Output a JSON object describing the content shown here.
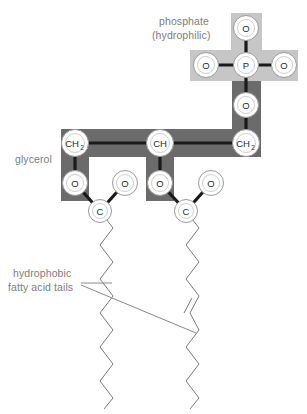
{
  "diagram": {
    "width": 307,
    "height": 414,
    "background": "#ffffff"
  },
  "labels": {
    "phosphate_line1": "phosphate",
    "phosphate_line2": "(hydrophilic)",
    "glycerol": "glycerol",
    "tails_line1": "hydrophobic",
    "tails_line2": "fatty acid tails"
  },
  "colors": {
    "label_text": "#7d7d7d",
    "atom_text": "#2b2b2b",
    "atom_fill": "#ffffff",
    "atom_stroke": "#9a9a9a",
    "bond": "#1a1a1a",
    "highlight_light": "#c6c6c6",
    "highlight_dark": "#6b6b6b",
    "tail_stroke": "#7a7a7a",
    "leader": "#8a8a8a"
  },
  "atoms": {
    "phosphate": [
      {
        "symbol": "O",
        "sub": "",
        "x": 246,
        "y": 28
      },
      {
        "symbol": "O",
        "sub": "",
        "x": 206,
        "y": 65
      },
      {
        "symbol": "P",
        "sub": "",
        "x": 246,
        "y": 65
      },
      {
        "symbol": "O",
        "sub": "",
        "x": 284,
        "y": 65
      },
      {
        "symbol": "O",
        "sub": "",
        "x": 246,
        "y": 105
      }
    ],
    "glycerol": [
      {
        "symbol": "CH",
        "sub": "2",
        "x": 75,
        "y": 143
      },
      {
        "symbol": "CH",
        "sub": "",
        "x": 160,
        "y": 143
      },
      {
        "symbol": "CH",
        "sub": "2",
        "x": 246,
        "y": 143
      }
    ],
    "ester_left": [
      {
        "symbol": "O",
        "sub": "",
        "x": 75,
        "y": 183
      },
      {
        "symbol": "O",
        "sub": "",
        "x": 125,
        "y": 183
      },
      {
        "symbol": "C",
        "sub": "",
        "x": 100,
        "y": 211
      }
    ],
    "ester_right": [
      {
        "symbol": "O",
        "sub": "",
        "x": 160,
        "y": 183
      },
      {
        "symbol": "O",
        "sub": "",
        "x": 211,
        "y": 183
      },
      {
        "symbol": "C",
        "sub": "",
        "x": 186,
        "y": 211
      }
    ]
  },
  "chain": {
    "left_tail_saturated": true,
    "right_tail_has_double_bond": true,
    "double_bond_y": 318
  }
}
